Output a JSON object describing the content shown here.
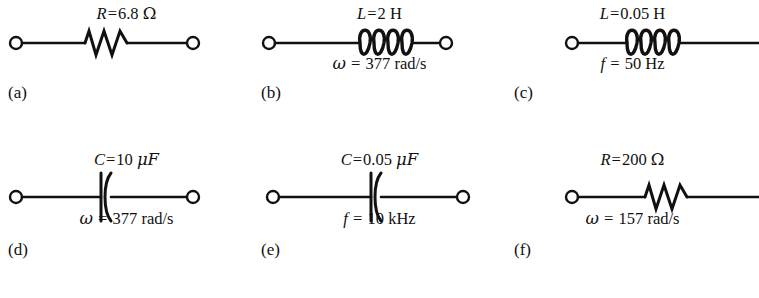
{
  "figure": {
    "background_color": "#ffffff",
    "ink_color": "#111111",
    "columns": 3,
    "rows": 2
  },
  "circuits": [
    {
      "caption": "(a)",
      "element": "resistor",
      "value": {
        "symbol": "R",
        "equals": "=",
        "number": "6.8",
        "unit": "Ω"
      },
      "frequency": {
        "symbol": "",
        "equals": "",
        "number": "",
        "unit": ""
      },
      "left_terminal": true,
      "right_terminal": true
    },
    {
      "caption": "(b)",
      "element": "inductor",
      "value": {
        "symbol": "L",
        "equals": "=",
        "number": "2",
        "unit": "H"
      },
      "frequency": {
        "symbol": "ω",
        "equals": "=",
        "number": "377",
        "unit": "rad/s"
      },
      "left_terminal": true,
      "right_terminal": true
    },
    {
      "caption": "(c)",
      "element": "inductor",
      "value": {
        "symbol": "L",
        "equals": "=",
        "number": "0.05",
        "unit": "H"
      },
      "frequency": {
        "symbol": "f",
        "equals": "=",
        "number": "50",
        "unit": "Hz"
      },
      "left_terminal": true,
      "right_terminal": false
    },
    {
      "caption": "(d)",
      "element": "capacitor",
      "value": {
        "symbol": "C",
        "equals": "=",
        "number": "10",
        "unit": "μF"
      },
      "frequency": {
        "symbol": "ω",
        "equals": "=",
        "number": "377",
        "unit": "rad/s"
      },
      "left_terminal": true,
      "right_terminal": true
    },
    {
      "caption": "(e)",
      "element": "capacitor",
      "value": {
        "symbol": "C",
        "equals": "=",
        "number": "0.05",
        "unit": "μF"
      },
      "frequency": {
        "symbol": "f",
        "equals": "=",
        "number": "10",
        "unit": "kHz"
      },
      "left_terminal": true,
      "right_terminal": true
    },
    {
      "caption": "(f)",
      "element": "resistor",
      "value": {
        "symbol": "R",
        "equals": "=",
        "number": "200",
        "unit": "Ω"
      },
      "frequency": {
        "symbol": "ω",
        "equals": "=",
        "number": "157",
        "unit": "rad/s"
      },
      "left_terminal": true,
      "right_terminal": false
    }
  ]
}
